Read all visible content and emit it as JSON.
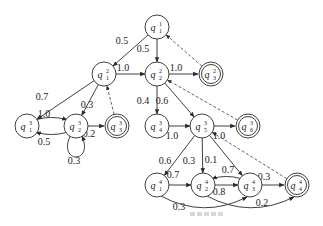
{
  "diagram": {
    "type": "hierarchical-hmm-state-graph",
    "nodes": [
      {
        "id": "q1_1",
        "base": "q",
        "sub": "1",
        "sup": "1",
        "x": 157,
        "y": 27,
        "final": false
      },
      {
        "id": "q1_2",
        "base": "q",
        "sub": "1",
        "sup": "2",
        "x": 104,
        "y": 74,
        "final": false
      },
      {
        "id": "q2_2",
        "base": "q",
        "sub": "2",
        "sup": "2",
        "x": 157,
        "y": 74,
        "final": false
      },
      {
        "id": "q3_2",
        "base": "q",
        "sub": "3",
        "sup": "2",
        "x": 211,
        "y": 74,
        "final": true
      },
      {
        "id": "q1_3",
        "base": "q",
        "sub": "1",
        "sup": "3",
        "x": 27,
        "y": 126,
        "final": false
      },
      {
        "id": "q2_3",
        "base": "q",
        "sub": "2",
        "sup": "3",
        "x": 76,
        "y": 126,
        "final": false
      },
      {
        "id": "q3_3",
        "base": "q",
        "sub": "3",
        "sup": "3",
        "x": 117,
        "y": 126,
        "final": true
      },
      {
        "id": "q4_3",
        "base": "q",
        "sub": "4",
        "sup": "3",
        "x": 157,
        "y": 126,
        "final": false
      },
      {
        "id": "q5_3",
        "base": "q",
        "sub": "5",
        "sup": "3",
        "x": 202,
        "y": 126,
        "final": false
      },
      {
        "id": "q6_3",
        "base": "q",
        "sub": "6",
        "sup": "3",
        "x": 248,
        "y": 126,
        "final": true
      },
      {
        "id": "q1_4",
        "base": "q",
        "sub": "1",
        "sup": "4",
        "x": 157,
        "y": 185,
        "final": false
      },
      {
        "id": "q2_4",
        "base": "q",
        "sub": "2",
        "sup": "4",
        "x": 203,
        "y": 185,
        "final": false
      },
      {
        "id": "q3_4",
        "base": "q",
        "sub": "3",
        "sup": "4",
        "x": 250,
        "y": 185,
        "final": false
      },
      {
        "id": "q4_4",
        "base": "q",
        "sub": "4",
        "sup": "4",
        "x": 297,
        "y": 185,
        "final": true
      }
    ],
    "edges": [
      {
        "from": "q1_1",
        "to": "q1_2",
        "label": "0.5",
        "style": "solid"
      },
      {
        "from": "q1_1",
        "to": "q2_2",
        "label": "0.5",
        "style": "solid"
      },
      {
        "from": "q3_2",
        "to": "q1_1",
        "label": "",
        "style": "dashed"
      },
      {
        "from": "q1_2",
        "to": "q2_2",
        "label": "1.0",
        "style": "solid"
      },
      {
        "from": "q2_2",
        "to": "q3_2",
        "label": "1.0",
        "style": "solid"
      },
      {
        "from": "q1_2",
        "to": "q1_3",
        "label": "0.7",
        "style": "solid"
      },
      {
        "from": "q1_2",
        "to": "q2_3",
        "label": "0.3",
        "style": "solid"
      },
      {
        "from": "q3_3",
        "to": "q1_2",
        "label": "",
        "style": "dashed"
      },
      {
        "from": "q1_3",
        "to": "q2_3",
        "label": "1.0",
        "style": "solid"
      },
      {
        "from": "q2_3",
        "to": "q1_3",
        "label": "0.5",
        "style": "solid"
      },
      {
        "from": "q2_3",
        "to": "q3_3",
        "label": "0.2",
        "style": "solid"
      },
      {
        "from": "q2_3",
        "to": "q2_3",
        "label": "0.3",
        "style": "self-loop"
      },
      {
        "from": "q2_2",
        "to": "q4_3",
        "label": "0.4",
        "style": "solid"
      },
      {
        "from": "q2_2",
        "to": "q5_3",
        "label": "0.6",
        "style": "solid"
      },
      {
        "from": "q6_3",
        "to": "q2_2",
        "label": "",
        "style": "dashed"
      },
      {
        "from": "q4_3",
        "to": "q5_3",
        "label": "1.0",
        "style": "solid"
      },
      {
        "from": "q5_3",
        "to": "q6_3",
        "label": "1.0",
        "style": "solid"
      },
      {
        "from": "q5_3",
        "to": "q1_4",
        "label": "0.6",
        "style": "solid"
      },
      {
        "from": "q5_3",
        "to": "q2_4",
        "label": "0.3",
        "style": "solid"
      },
      {
        "from": "q5_3",
        "to": "q3_4",
        "label": "0.1",
        "style": "solid"
      },
      {
        "from": "q4_4",
        "to": "q5_3",
        "label": "",
        "style": "dashed"
      },
      {
        "from": "q1_4",
        "to": "q2_4",
        "label": "0.7",
        "style": "solid"
      },
      {
        "from": "q2_4",
        "to": "q3_4",
        "label": "0.8",
        "style": "solid"
      },
      {
        "from": "q3_4",
        "to": "q2_4",
        "label": "0.7",
        "style": "solid"
      },
      {
        "from": "q3_4",
        "to": "q4_4",
        "label": "0.3",
        "style": "solid"
      },
      {
        "from": "q1_4",
        "to": "q3_4",
        "label": "0.3",
        "style": "curved"
      },
      {
        "from": "q2_4",
        "to": "q4_4",
        "label": "0.2",
        "style": "curved"
      }
    ],
    "caption": ""
  }
}
